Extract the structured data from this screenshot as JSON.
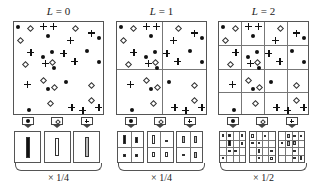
{
  "colors": {
    "ink": "#111111",
    "border": "#555555",
    "background": "#ffffff",
    "bar_filled": "#111111",
    "bar_hollow": "#ffffff",
    "bar_gray": "#999999"
  },
  "feature_types": [
    {
      "id": "dot",
      "name": "filled-circle",
      "icon": "filled-circle-icon"
    },
    {
      "id": "dia",
      "name": "hollow-diamond",
      "icon": "hollow-diamond-icon"
    },
    {
      "id": "plus",
      "name": "plus",
      "icon": "plus-icon"
    }
  ],
  "points": [
    {
      "x": 0.05,
      "y": 0.05,
      "t": "dot"
    },
    {
      "x": 0.18,
      "y": 0.06,
      "t": "dia"
    },
    {
      "x": 0.33,
      "y": 0.05,
      "t": "plus"
    },
    {
      "x": 0.44,
      "y": 0.05,
      "t": "plus"
    },
    {
      "x": 0.68,
      "y": 0.06,
      "t": "dia"
    },
    {
      "x": 0.87,
      "y": 0.12,
      "t": "plus"
    },
    {
      "x": 0.38,
      "y": 0.15,
      "t": "dot"
    },
    {
      "x": 0.07,
      "y": 0.2,
      "t": "dia"
    },
    {
      "x": 0.63,
      "y": 0.2,
      "t": "plus"
    },
    {
      "x": 0.95,
      "y": 0.17,
      "t": "dot"
    },
    {
      "x": 0.19,
      "y": 0.33,
      "t": "plus"
    },
    {
      "x": 0.43,
      "y": 0.33,
      "t": "dot"
    },
    {
      "x": 0.56,
      "y": 0.34,
      "t": "plus"
    },
    {
      "x": 0.82,
      "y": 0.32,
      "t": "dot"
    },
    {
      "x": 0.33,
      "y": 0.38,
      "t": "dot"
    },
    {
      "x": 0.12,
      "y": 0.46,
      "t": "dia"
    },
    {
      "x": 0.35,
      "y": 0.45,
      "t": "plus"
    },
    {
      "x": 0.43,
      "y": 0.43,
      "t": "dia"
    },
    {
      "x": 0.45,
      "y": 0.5,
      "t": "dot"
    },
    {
      "x": 0.68,
      "y": 0.43,
      "t": "plus"
    },
    {
      "x": 0.95,
      "y": 0.44,
      "t": "dot"
    },
    {
      "x": 0.33,
      "y": 0.63,
      "t": "dia"
    },
    {
      "x": 0.15,
      "y": 0.68,
      "t": "plus"
    },
    {
      "x": 0.45,
      "y": 0.71,
      "t": "dia"
    },
    {
      "x": 0.38,
      "y": 0.73,
      "t": "dot"
    },
    {
      "x": 0.58,
      "y": 0.65,
      "t": "dot"
    },
    {
      "x": 0.87,
      "y": 0.68,
      "t": "dia"
    },
    {
      "x": 0.4,
      "y": 0.88,
      "t": "dia"
    },
    {
      "x": 0.87,
      "y": 0.85,
      "t": "dia"
    },
    {
      "x": 0.17,
      "y": 0.96,
      "t": "dot"
    },
    {
      "x": 0.65,
      "y": 0.93,
      "t": "plus"
    },
    {
      "x": 0.77,
      "y": 0.96,
      "t": "plus"
    },
    {
      "x": 0.95,
      "y": 0.93,
      "t": "plus"
    }
  ],
  "levels": [
    {
      "label_var": "L",
      "label_eq": " = 0",
      "level": 0,
      "grid": 1,
      "scale": "× 1/4",
      "hist": [
        {
          "bars": [
            {
              "x": 0.5,
              "y": 0.5,
              "h": 0.7,
              "fill": "#111111"
            }
          ]
        },
        {
          "bars": [
            {
              "x": 0.5,
              "y": 0.5,
              "h": 0.6,
              "fill": "#ffffff"
            }
          ]
        },
        {
          "bars": [
            {
              "x": 0.5,
              "y": 0.5,
              "h": 0.65,
              "fill": "#bbbbbb"
            }
          ]
        }
      ]
    },
    {
      "label_var": "L",
      "label_eq": " = 1",
      "level": 1,
      "grid": 2,
      "scale": "× 1/4",
      "hist": [
        {
          "bars": [
            {
              "x": 0.25,
              "y": 0.25,
              "h": 0.3,
              "fill": "#111111"
            },
            {
              "x": 0.75,
              "y": 0.27,
              "h": 0.2,
              "fill": "#111111"
            },
            {
              "x": 0.25,
              "y": 0.77,
              "h": 0.1,
              "fill": "#111111"
            },
            {
              "x": 0.75,
              "y": 0.77,
              "h": 0.1,
              "fill": "#111111"
            }
          ]
        },
        {
          "bars": [
            {
              "x": 0.25,
              "y": 0.25,
              "h": 0.28,
              "fill": "#ffffff"
            },
            {
              "x": 0.75,
              "y": 0.3,
              "h": 0.06,
              "fill": "#111111"
            },
            {
              "x": 0.25,
              "y": 0.75,
              "h": 0.15,
              "fill": "#ffffff"
            },
            {
              "x": 0.75,
              "y": 0.75,
              "h": 0.15,
              "fill": "#ffffff"
            }
          ]
        },
        {
          "bars": [
            {
              "x": 0.25,
              "y": 0.25,
              "h": 0.25,
              "fill": "#bbbbbb"
            },
            {
              "x": 0.75,
              "y": 0.25,
              "h": 0.25,
              "fill": "#bbbbbb"
            },
            {
              "x": 0.25,
              "y": 0.77,
              "h": 0.08,
              "fill": "#111111"
            },
            {
              "x": 0.75,
              "y": 0.75,
              "h": 0.2,
              "fill": "#bbbbbb"
            }
          ]
        }
      ]
    },
    {
      "label_var": "L",
      "label_eq": " = 2",
      "level": 2,
      "grid": 4,
      "scale": "× 1/2",
      "hist": [
        {
          "bars": [
            {
              "x": 0.125,
              "y": 0.125,
              "h": 0.1,
              "fill": "#111111"
            },
            {
              "x": 0.375,
              "y": 0.125,
              "h": 0.1,
              "fill": "#111111"
            },
            {
              "x": 0.375,
              "y": 0.35,
              "h": 0.2,
              "fill": "#111111"
            },
            {
              "x": 0.875,
              "y": 0.125,
              "h": 0.1,
              "fill": "#111111"
            },
            {
              "x": 0.875,
              "y": 0.375,
              "h": 0.1,
              "fill": "#111111"
            },
            {
              "x": 0.375,
              "y": 0.625,
              "h": 0.08,
              "fill": "#111111"
            },
            {
              "x": 0.625,
              "y": 0.625,
              "h": 0.08,
              "fill": "#111111"
            },
            {
              "x": 0.125,
              "y": 0.875,
              "h": 0.08,
              "fill": "#111111"
            }
          ]
        },
        {
          "bars": [
            {
              "x": 0.125,
              "y": 0.125,
              "h": 0.12,
              "fill": "#ffffff"
            },
            {
              "x": 0.625,
              "y": 0.125,
              "h": 0.08,
              "fill": "#111111"
            },
            {
              "x": 0.125,
              "y": 0.375,
              "h": 0.08,
              "fill": "#111111"
            },
            {
              "x": 0.375,
              "y": 0.375,
              "h": 0.08,
              "fill": "#111111"
            },
            {
              "x": 0.375,
              "y": 0.625,
              "h": 0.15,
              "fill": "#ffffff"
            },
            {
              "x": 0.875,
              "y": 0.625,
              "h": 0.08,
              "fill": "#111111"
            },
            {
              "x": 0.375,
              "y": 0.875,
              "h": 0.08,
              "fill": "#111111"
            },
            {
              "x": 0.875,
              "y": 0.875,
              "h": 0.1,
              "fill": "#ffffff"
            }
          ]
        },
        {
          "bars": [
            {
              "x": 0.375,
              "y": 0.125,
              "h": 0.12,
              "fill": "#bbbbbb"
            },
            {
              "x": 0.625,
              "y": 0.125,
              "h": 0.08,
              "fill": "#111111"
            },
            {
              "x": 0.875,
              "y": 0.125,
              "h": 0.08,
              "fill": "#111111"
            },
            {
              "x": 0.125,
              "y": 0.375,
              "h": 0.08,
              "fill": "#111111"
            },
            {
              "x": 0.375,
              "y": 0.375,
              "h": 0.15,
              "fill": "#bbbbbb"
            },
            {
              "x": 0.625,
              "y": 0.375,
              "h": 0.12,
              "fill": "#bbbbbb"
            },
            {
              "x": 0.625,
              "y": 0.625,
              "h": 0.08,
              "fill": "#111111"
            },
            {
              "x": 0.625,
              "y": 0.875,
              "h": 0.08,
              "fill": "#111111"
            },
            {
              "x": 0.875,
              "y": 0.875,
              "h": 0.12,
              "fill": "#bbbbbb"
            }
          ]
        }
      ]
    }
  ]
}
